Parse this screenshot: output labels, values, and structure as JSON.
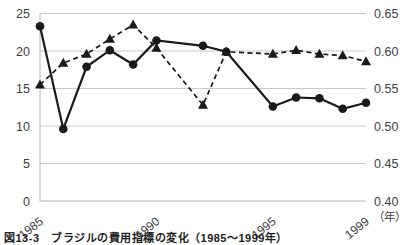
{
  "caption": "図13-3　ブラジルの費用指標の変化（1985～1999年）",
  "colors": {
    "series_line": "#1a1a1a",
    "grid": "#c9c9c9",
    "axis_line": "#b5b5b5",
    "tick_text": "#3f3f3f",
    "background": "#ffffff"
  },
  "chart_data": {
    "type": "line",
    "title": "",
    "xlabel": "（年）",
    "ylabel_left": "",
    "ylabel_right": "",
    "grid": true,
    "legend": "none",
    "x": [
      1985,
      1986,
      1987,
      1988,
      1989,
      1990,
      1992,
      1993,
      1995,
      1996,
      1997,
      1998,
      1999
    ],
    "series": [
      {
        "name": "solid-circle-series",
        "axis": "left",
        "marker": "circle",
        "line_style": "solid",
        "values": [
          23.3,
          9.6,
          17.9,
          20.1,
          18.2,
          21.4,
          20.7,
          19.9,
          12.6,
          13.8,
          13.7,
          12.3,
          13.1
        ]
      },
      {
        "name": "dashed-triangle-series",
        "axis": "right",
        "marker": "triangle",
        "line_style": "dashed",
        "values": [
          0.555,
          0.584,
          0.596,
          0.616,
          0.635,
          0.604,
          0.528,
          0.599,
          0.596,
          0.601,
          0.596,
          0.594,
          0.586
        ]
      }
    ],
    "left_axis": {
      "min": 0,
      "max": 25,
      "ticks": [
        25,
        20,
        15,
        10,
        5,
        0
      ],
      "tick_labels": [
        "25",
        "20",
        "15",
        "10",
        "5",
        "0"
      ]
    },
    "right_axis": {
      "min": 0.4,
      "max": 0.65,
      "ticks": [
        0.65,
        0.6,
        0.55,
        0.5,
        0.45,
        0.4
      ],
      "tick_labels": [
        "0.65",
        "0.60",
        "0.55",
        "0.50",
        "0.45",
        "0.40"
      ]
    },
    "x_axis": {
      "min": 1985,
      "max": 1999,
      "tick_years": [
        1985,
        1990,
        1995,
        1999
      ],
      "tick_labels": [
        "1985",
        "1990",
        "1995",
        "1999"
      ],
      "unit_label": "（年）"
    }
  }
}
